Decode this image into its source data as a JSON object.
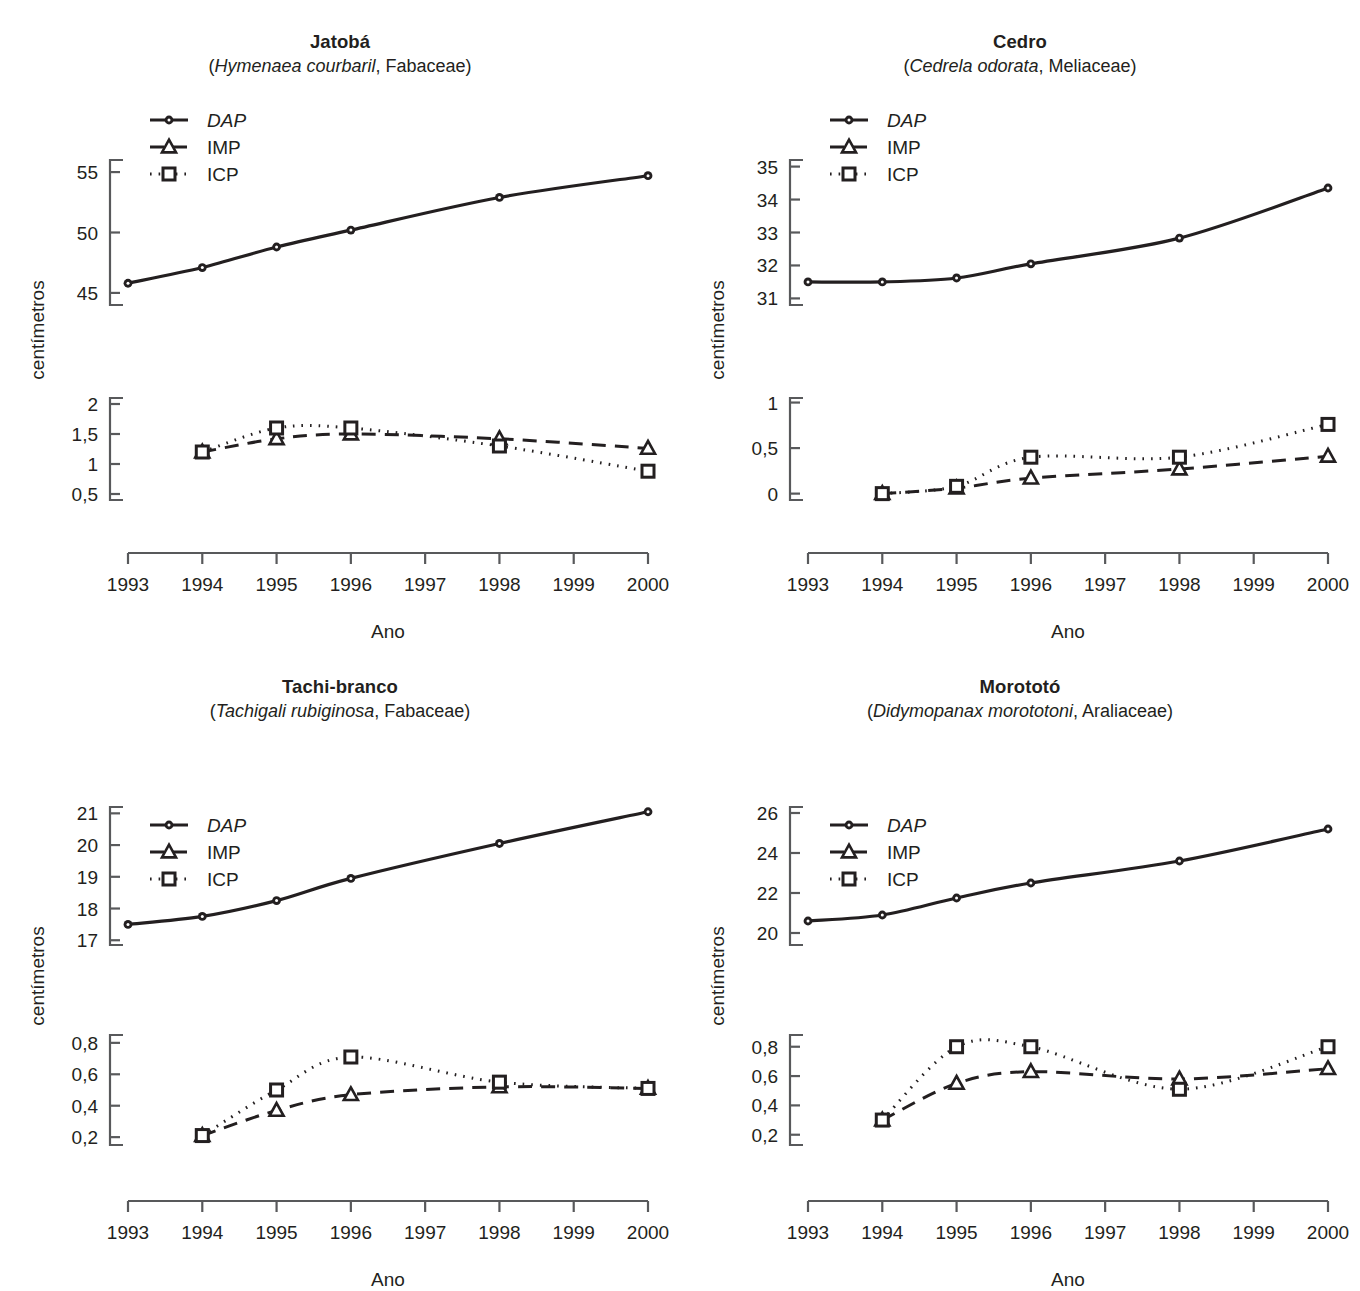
{
  "figure": {
    "axis_label_y": "centímetros",
    "axis_label_x": "Ano",
    "years": [
      "1993",
      "1994",
      "1995",
      "1996",
      "1997",
      "1998",
      "1999",
      "2000"
    ],
    "ink_color": "#231f20"
  },
  "legend": {
    "items": [
      {
        "key": "DAP",
        "label": "DAP",
        "marker": "circle-filled",
        "line": "solid",
        "italic": true
      },
      {
        "key": "IMP",
        "label": "IMP",
        "marker": "triangle-open",
        "line": "dashed",
        "italic": false
      },
      {
        "key": "ICP",
        "label": "ICP",
        "marker": "square-open",
        "line": "dotted",
        "italic": false
      }
    ]
  },
  "chart_data": [
    {
      "id": "jatoba",
      "type": "line",
      "title": "Jatobá",
      "subtitle_species": "Hymenaea courbaril",
      "subtitle_family": "Fabaceae",
      "xlabel": "Ano",
      "ylabel": "centímetros",
      "x": [
        1993,
        1994,
        1995,
        1996,
        1998,
        2000
      ],
      "xlim": [
        1993,
        2000
      ],
      "xticks": [
        1993,
        1994,
        1995,
        1996,
        1997,
        1998,
        1999,
        2000
      ],
      "upper": {
        "yticks": [
          45,
          50,
          55
        ],
        "ytick_labels": [
          "45",
          "50",
          "55"
        ],
        "ylim": [
          44,
          56
        ],
        "series": [
          {
            "name": "DAP",
            "x": [
              1993,
              1994,
              1995,
              1996,
              1998,
              2000
            ],
            "values": [
              45.8,
              47.1,
              48.8,
              50.2,
              52.9,
              54.7
            ]
          }
        ]
      },
      "lower": {
        "yticks": [
          0.5,
          1,
          1.5,
          2
        ],
        "ytick_labels": [
          "0,5",
          "1",
          "1,5",
          "2"
        ],
        "ylim": [
          0.4,
          2.1
        ],
        "series": [
          {
            "name": "IMP",
            "x": [
              1994,
              1995,
              1996,
              1998,
              2000
            ],
            "values": [
              1.2,
              1.42,
              1.5,
              1.42,
              1.26
            ]
          },
          {
            "name": "ICP",
            "x": [
              1994,
              1995,
              1996,
              1998,
              2000
            ],
            "values": [
              1.2,
              1.6,
              1.6,
              1.3,
              0.88
            ]
          }
        ]
      }
    },
    {
      "id": "cedro",
      "type": "line",
      "title": "Cedro",
      "subtitle_species": "Cedrela odorata",
      "subtitle_family": "Meliaceae",
      "xlabel": "Ano",
      "ylabel": "centímetros",
      "x": [
        1993,
        1994,
        1995,
        1996,
        1998,
        2000
      ],
      "xlim": [
        1993,
        2000
      ],
      "xticks": [
        1993,
        1994,
        1995,
        1996,
        1997,
        1998,
        1999,
        2000
      ],
      "upper": {
        "yticks": [
          31,
          32,
          33,
          34,
          35
        ],
        "ytick_labels": [
          "31",
          "32",
          "33",
          "34",
          "35"
        ],
        "ylim": [
          30.8,
          35.2
        ],
        "series": [
          {
            "name": "DAP",
            "x": [
              1993,
              1994,
              1995,
              1996,
              1998,
              2000
            ],
            "values": [
              31.5,
              31.5,
              31.62,
              32.05,
              32.83,
              34.35
            ]
          }
        ]
      },
      "lower": {
        "yticks": [
          0,
          0.5,
          1
        ],
        "ytick_labels": [
          "0",
          "0,5",
          "1"
        ],
        "ylim": [
          -0.07,
          1.05
        ],
        "series": [
          {
            "name": "IMP",
            "x": [
              1994,
              1995,
              1996,
              1998,
              2000
            ],
            "values": [
              0.0,
              0.06,
              0.17,
              0.27,
              0.41
            ]
          },
          {
            "name": "ICP",
            "x": [
              1994,
              1995,
              1996,
              1998,
              2000
            ],
            "values": [
              0.0,
              0.08,
              0.4,
              0.4,
              0.76
            ]
          }
        ]
      }
    },
    {
      "id": "tachi-branco",
      "type": "line",
      "title": "Tachi-branco",
      "subtitle_species": "Tachigali rubiginosa",
      "subtitle_family": "Fabaceae",
      "xlabel": "Ano",
      "ylabel": "centímetros",
      "x": [
        1993,
        1994,
        1995,
        1996,
        1998,
        2000
      ],
      "xlim": [
        1993,
        2000
      ],
      "xticks": [
        1993,
        1994,
        1995,
        1996,
        1997,
        1998,
        1999,
        2000
      ],
      "upper": {
        "yticks": [
          17,
          18,
          19,
          20,
          21
        ],
        "ytick_labels": [
          "17",
          "18",
          "19",
          "20",
          "21"
        ],
        "ylim": [
          16.85,
          21.2
        ],
        "series": [
          {
            "name": "DAP",
            "x": [
              1993,
              1994,
              1995,
              1996,
              1998,
              2000
            ],
            "values": [
              17.5,
              17.75,
              18.25,
              18.95,
              20.05,
              21.05
            ]
          }
        ]
      },
      "lower": {
        "yticks": [
          0.2,
          0.4,
          0.6,
          0.8
        ],
        "ytick_labels": [
          "0,2",
          "0,4",
          "0,6",
          "0,8"
        ],
        "ylim": [
          0.15,
          0.85
        ],
        "series": [
          {
            "name": "IMP",
            "x": [
              1994,
              1995,
              1996,
              1998,
              2000
            ],
            "values": [
              0.21,
              0.37,
              0.47,
              0.52,
              0.51
            ]
          },
          {
            "name": "ICP",
            "x": [
              1994,
              1995,
              1996,
              1998,
              2000
            ],
            "values": [
              0.21,
              0.5,
              0.71,
              0.55,
              0.51
            ]
          }
        ]
      }
    },
    {
      "id": "morototo",
      "type": "line",
      "title": "Morototó",
      "subtitle_species": "Didymopanax morototoni",
      "subtitle_family": "Araliaceae",
      "xlabel": "Ano",
      "ylabel": "centímetros",
      "x": [
        1993,
        1994,
        1995,
        1996,
        1998,
        2000
      ],
      "xlim": [
        1993,
        2000
      ],
      "xticks": [
        1993,
        1994,
        1995,
        1996,
        1997,
        1998,
        1999,
        2000
      ],
      "upper": {
        "yticks": [
          20,
          22,
          24,
          26
        ],
        "ytick_labels": [
          "20",
          "22",
          "24",
          "26"
        ],
        "ylim": [
          19.4,
          26.3
        ],
        "series": [
          {
            "name": "DAP",
            "x": [
              1993,
              1994,
              1995,
              1996,
              1998,
              2000
            ],
            "values": [
              20.6,
              20.9,
              21.75,
              22.5,
              23.6,
              25.2
            ]
          }
        ]
      },
      "lower": {
        "yticks": [
          0.2,
          0.4,
          0.6,
          0.8
        ],
        "ytick_labels": [
          "0,2",
          "0,4",
          "0,6",
          "0,8"
        ],
        "ylim": [
          0.13,
          0.88
        ],
        "series": [
          {
            "name": "IMP",
            "x": [
              1994,
              1995,
              1996,
              1998,
              2000
            ],
            "values": [
              0.3,
              0.55,
              0.63,
              0.58,
              0.65
            ]
          },
          {
            "name": "ICP",
            "x": [
              1994,
              1995,
              1996,
              1998,
              2000
            ],
            "values": [
              0.3,
              0.8,
              0.8,
              0.51,
              0.8
            ]
          }
        ]
      }
    }
  ]
}
